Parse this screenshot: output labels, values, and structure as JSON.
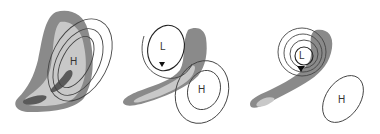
{
  "panels": [
    {
      "id": "stage-1",
      "labels": [
        {
          "text": "H",
          "role": "high-pressure-center"
        }
      ],
      "description": "Comma-shaped cloud band with nested high-pressure isobars"
    },
    {
      "id": "stage-2",
      "labels": [
        {
          "text": "L",
          "role": "low-pressure-center"
        },
        {
          "text": "H",
          "role": "high-pressure-center"
        }
      ],
      "description": "Developing low with circulation arrow and cloud band, high to southeast"
    },
    {
      "id": "stage-3",
      "labels": [
        {
          "text": "L",
          "role": "low-pressure-center"
        },
        {
          "text": "H",
          "role": "high-pressure-center"
        }
      ],
      "description": "Mature spiraling low with cloud hook, isolated high to southeast"
    }
  ],
  "colors": {
    "cloud_dark": "#8a8a8a",
    "cloud_light": "#c8c8c8",
    "cloud_core": "#5a5a5a",
    "isobar": "#444444",
    "background": "#ffffff"
  }
}
